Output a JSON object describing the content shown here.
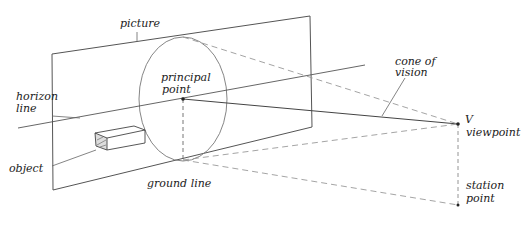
{
  "diagram": {
    "type": "perspective-projection-sketch",
    "labels": {
      "picture": "picture",
      "principal_point": [
        "principal",
        "point"
      ],
      "horizon_line": [
        "horizon",
        "line"
      ],
      "object": "object",
      "ground_line": "ground line",
      "cone_of_vision": [
        "cone of",
        "vision"
      ],
      "viewpoint_letter": "V",
      "viewpoint": "viewpoint",
      "station_point": [
        "station",
        "point"
      ]
    },
    "colors": {
      "line": "#555555",
      "dashed": "#9a9a9a",
      "text": "#222222",
      "background": "#ffffff"
    }
  }
}
